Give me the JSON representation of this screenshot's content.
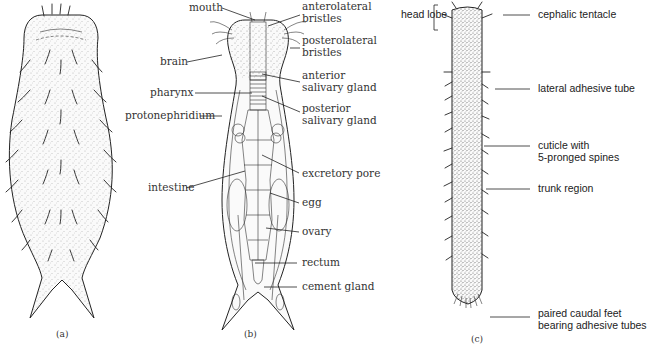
{
  "figure": {
    "panels": [
      {
        "id": "a",
        "label": "(a)"
      },
      {
        "id": "b",
        "label": "(b)"
      },
      {
        "id": "c",
        "label": "(c)"
      }
    ],
    "panel_b_labels_left": [
      {
        "text": "mouth"
      },
      {
        "text": "brain"
      },
      {
        "text": "pharynx"
      },
      {
        "text": "protonephridium"
      },
      {
        "text": "intestine"
      }
    ],
    "panel_b_labels_right": [
      {
        "line1": "anterolateral",
        "line2": "bristles"
      },
      {
        "line1": "posterolateral",
        "line2": "bristles"
      },
      {
        "line1": "anterior",
        "line2": "salivary gland"
      },
      {
        "line1": "posterior",
        "line2": "salivary gland"
      },
      {
        "line1": "excretory pore",
        "line2": ""
      },
      {
        "line1": "egg",
        "line2": ""
      },
      {
        "line1": "ovary",
        "line2": ""
      },
      {
        "line1": "rectum",
        "line2": ""
      },
      {
        "line1": "cement gland",
        "line2": ""
      }
    ],
    "panel_c_labels": {
      "head_lobe": "head lobe",
      "right": [
        {
          "line1": "cephalic tentacle",
          "line2": ""
        },
        {
          "line1": "lateral adhesive tube",
          "line2": ""
        },
        {
          "line1": "cuticle with",
          "line2": "5-pronged spines"
        },
        {
          "line1": "trunk region",
          "line2": ""
        },
        {
          "line1": "paired caudal feet",
          "line2": "bearing adhesive tubes"
        }
      ]
    }
  }
}
